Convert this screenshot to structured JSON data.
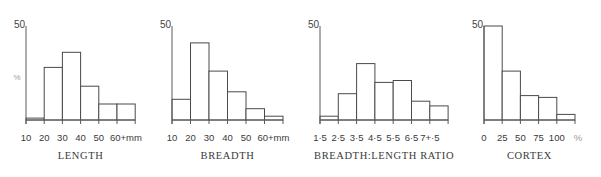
{
  "chart_data": [
    {
      "type": "bar",
      "title": "LENGTH",
      "xlabel": "LENGTH",
      "ylabel": "%",
      "ylim": [
        0,
        50
      ],
      "y_top_label": "50",
      "tick_labels": [
        "10",
        "20",
        "30",
        "40",
        "50",
        "60+mm"
      ],
      "categories": [
        "10-20",
        "20-30",
        "30-40",
        "40-50",
        "50-60",
        "60+"
      ],
      "values": [
        1,
        28,
        36,
        18,
        8.5,
        8.5
      ],
      "unit": "mm",
      "layout": {
        "axis_x": 26,
        "bar_width": 18.2
      }
    },
    {
      "type": "bar",
      "title": "BREADTH",
      "xlabel": "BREADTH",
      "ylabel": "%",
      "ylim": [
        0,
        50
      ],
      "y_top_label": "50",
      "tick_labels": [
        "10",
        "20",
        "30",
        "40",
        "50",
        "60+mm"
      ],
      "categories": [
        "10-20",
        "20-30",
        "30-40",
        "40-50",
        "50-60",
        "60+"
      ],
      "values": [
        11,
        41,
        26,
        15,
        6,
        2
      ],
      "unit": "mm",
      "layout": {
        "axis_x": 172,
        "bar_width": 18.5
      }
    },
    {
      "type": "bar",
      "title": "BREADTH:LENGTH RATIO",
      "xlabel": "BREADTH:LENGTH RATIO",
      "ylabel": "%",
      "ylim": [
        0,
        50
      ],
      "y_top_label": "50",
      "tick_labels": [
        "1·5",
        "2·5",
        "3·5",
        "4·5",
        "5·5",
        "6·5",
        "7+·5"
      ],
      "categories": [
        "1·5-2·5",
        "2·5-3·5",
        "3·5-4·5",
        "4·5-5·5",
        "5·5-6·5",
        "6·5-7·5",
        "7·5+"
      ],
      "values": [
        2,
        14,
        30,
        20,
        21,
        10,
        7.5
      ],
      "unit": "",
      "layout": {
        "axis_x": 320,
        "bar_width": 18.3
      }
    },
    {
      "type": "bar",
      "title": "CORTEX",
      "xlabel": "CORTEX",
      "ylabel": "%",
      "ylim": [
        0,
        50
      ],
      "y_top_label": "50",
      "tick_labels": [
        "0",
        "25",
        "50",
        "75",
        "100",
        "%"
      ],
      "categories": [
        "0-25",
        "25-50",
        "50-75",
        "75-100",
        "100"
      ],
      "values": [
        50,
        26,
        13,
        12,
        3
      ],
      "unit": "%",
      "layout": {
        "axis_x": 484,
        "bar_width": 18.2
      }
    }
  ],
  "y_axis_unit_label": "%"
}
